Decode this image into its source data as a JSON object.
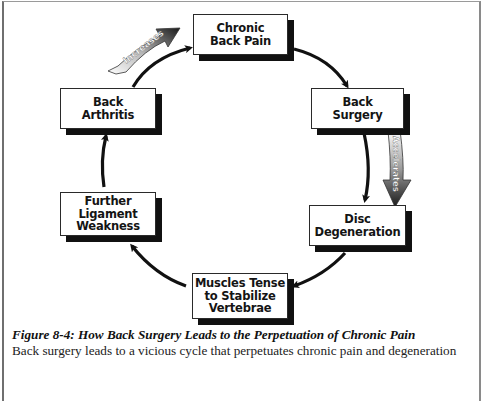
{
  "figure": {
    "nodes": [
      {
        "id": "chronic-back-pain",
        "label": "Chronic\nBack Pain"
      },
      {
        "id": "back-surgery",
        "label": "Back\nSurgery"
      },
      {
        "id": "disc-degeneration",
        "label": "Disc\nDegeneration"
      },
      {
        "id": "muscles-tense",
        "label": "Muscles Tense\nto Stabilize\nVertebrae"
      },
      {
        "id": "further-ligament-weakness",
        "label": "Further\nLigament\nWeakness"
      },
      {
        "id": "back-arthritis",
        "label": "Back\nArthritis"
      }
    ],
    "edges": [
      {
        "from": "chronic-back-pain",
        "to": "back-surgery"
      },
      {
        "from": "back-surgery",
        "to": "disc-degeneration"
      },
      {
        "from": "disc-degeneration",
        "to": "muscles-tense"
      },
      {
        "from": "muscles-tense",
        "to": "further-ligament-weakness"
      },
      {
        "from": "further-ligament-weakness",
        "to": "back-arthritis"
      },
      {
        "from": "back-arthritis",
        "to": "chronic-back-pain"
      }
    ],
    "ribbons": [
      {
        "id": "increases",
        "label": "Increases",
        "near_edge": "back-arthritis->chronic-back-pain"
      },
      {
        "id": "accelerates",
        "label": "Accelerates",
        "near_edge": "back-surgery->disc-degeneration"
      }
    ],
    "caption": "Figure 8-4:  How Back Surgery Leads to the Perpetuation of Chronic Pain",
    "caption_body_partial": "Back surgery leads to a vicious cycle that perpetuates chronic pain and degeneration"
  },
  "colors": {
    "box_border": "#2a2a2a",
    "box_shadow": "#111111",
    "arrow": "#111111",
    "frame": "#6f6f6f"
  }
}
